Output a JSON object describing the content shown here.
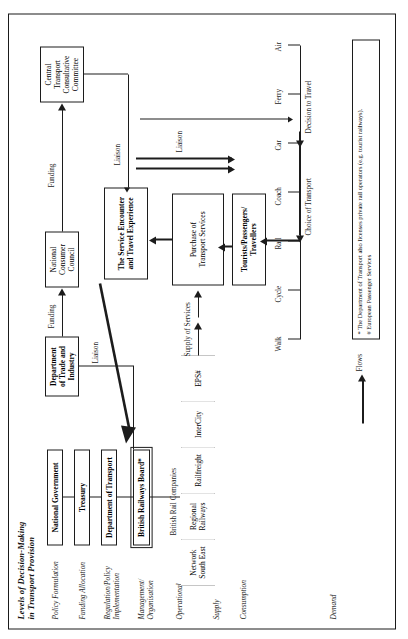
{
  "figure": {
    "title_line1": "Levels of Decision-Making",
    "title_line2": "in Transport Provision",
    "levels": [
      {
        "id": "policy-formulation",
        "text": "Policy Formulation"
      },
      {
        "id": "funding-allocation",
        "text": "Funding Allocation"
      },
      {
        "id": "regulation-policy-implementation",
        "line1": "Regulation/Policy",
        "line2": "Implementation"
      },
      {
        "id": "management-organisation",
        "line1": "Management/",
        "line2": "Organisation"
      },
      {
        "id": "operational",
        "text": "Operational"
      },
      {
        "id": "supply",
        "text": "Supply"
      },
      {
        "id": "consumption",
        "text": "Consumption"
      },
      {
        "id": "demand",
        "text": "Demand"
      }
    ],
    "boxes": {
      "national_government": "National Government",
      "treasury": "Treasury",
      "department_of_transport": "Department of Transport",
      "british_railways_board": "British Railways Board*",
      "department_of_trade_and_industry_l1": "Department",
      "department_of_trade_and_industry_l2": "of Trade and",
      "department_of_trade_and_industry_l3": "Industry",
      "national_consumer_council_l1": "National",
      "national_consumer_council_l2": "Consumer",
      "national_consumer_council_l3": "Council",
      "central_transport_consultative_committee_l1": "Central",
      "central_transport_consultative_committee_l2": "Transport",
      "central_transport_consultative_committee_l3": "Consultative",
      "central_transport_consultative_committee_l4": "Committee",
      "service_encounter_l1": "The Service Encounter",
      "service_encounter_l2": "and Travel Experience",
      "purchase_of_transport_services_l1": "Purchase of",
      "purchase_of_transport_services_l2": "Transport Services",
      "tourists_passengers_travellers_l1": "Tourists/Passengers/",
      "tourists_passengers_travellers_l2": "Travellers"
    },
    "british_rail_companies_label": "British Rail Companies",
    "rail_companies": [
      {
        "id": "network-south-east",
        "line1": "Network",
        "line2": "South East"
      },
      {
        "id": "regional-railways",
        "line1": "Regional",
        "line2": "Railways"
      },
      {
        "id": "railfreight",
        "line1": "Railfreight",
        "line2": ""
      },
      {
        "id": "intercity",
        "line1": "InterCity",
        "line2": ""
      },
      {
        "id": "eps",
        "line1": "EPS#",
        "line2": ""
      }
    ],
    "flow_labels": {
      "liaison_brb": "Liaison",
      "funding_dti_ncc": "Funding",
      "funding_ctcc": "Funding",
      "liaison_service_encounter": "Liaison",
      "liaison_travellers": "Liaison",
      "supply_of_services": "Supply of Services",
      "choice_of_transport": "Choice of Transport",
      "decision_to_travel": "Decision to Travel"
    },
    "transport_modes": [
      "Walk",
      "Cycle",
      "Rail",
      "Coach",
      "Car",
      "Ferry",
      "Air"
    ],
    "footnote": {
      "line1": "* The Department of Transport also licenses private rail operators (e.g. tourist railways).",
      "line2": "# European Passenger Services"
    },
    "legend": {
      "label": "Flows"
    },
    "colors": {
      "ink": "#1c1c1c",
      "paper": "#ffffff"
    }
  }
}
